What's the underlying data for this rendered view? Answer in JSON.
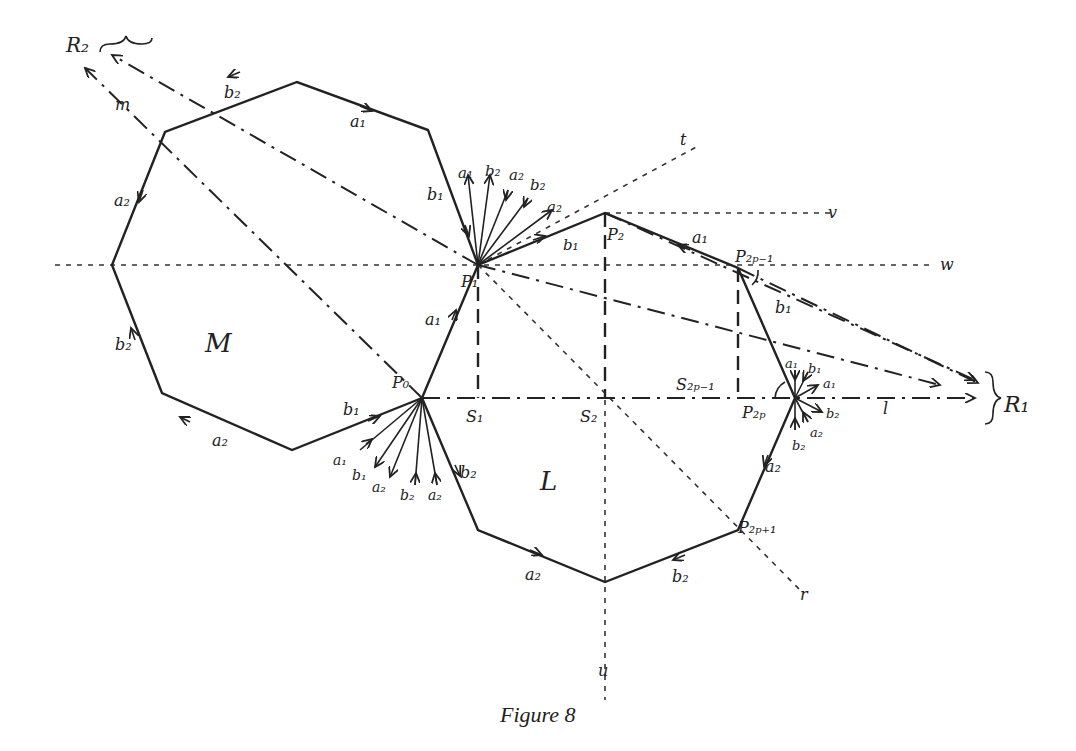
{
  "figure": {
    "caption": "Figure 8",
    "regions": {
      "M": "M",
      "L": "L"
    },
    "points": {
      "P0": "P₀",
      "P1": "P₁",
      "P2": "P₂",
      "P2p_minus_1": "P₂ₚ₋₁",
      "P2p": "P₂ₚ",
      "P2p_plus_1": "P₂ₚ₊₁",
      "S1": "S₁",
      "S2": "S₂",
      "S2p_minus_1": "S₂ₚ₋₁",
      "R1": "R₁",
      "R2": "R₂"
    },
    "lines": {
      "t": "t",
      "v": "v",
      "w": "w",
      "l": "l",
      "m": "m",
      "r": "r",
      "u": "u"
    },
    "edge_labels": {
      "a1": "a₁",
      "a2": "a₂",
      "b1": "b₁",
      "b2": "b₂"
    }
  }
}
